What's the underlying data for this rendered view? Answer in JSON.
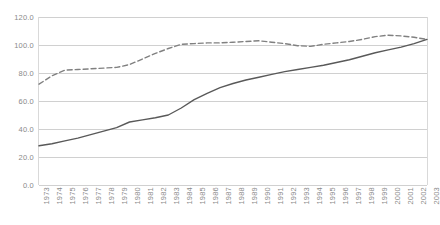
{
  "chart_data": {
    "type": "line",
    "title": "",
    "subtitle": "",
    "xlabel": "",
    "ylabel": "",
    "ylim": [
      0,
      120
    ],
    "ytick_step": 20,
    "yticks": [
      "0.0",
      "20.0",
      "40.0",
      "60.0",
      "80.0",
      "100.0",
      "120.0"
    ],
    "grid": "horizontal",
    "legend": "none",
    "x": [
      "1973",
      "1974",
      "1975",
      "1976",
      "1977",
      "1978",
      "1979",
      "1980",
      "1981",
      "1982",
      "1983",
      "1984",
      "1985",
      "1986",
      "1987",
      "1988",
      "1989",
      "1990",
      "1991",
      "1992",
      "1993",
      "1994",
      "1995",
      "1996",
      "1997",
      "1998",
      "1999",
      "2000",
      "2001",
      "2002",
      "2003"
    ],
    "series": [
      {
        "name": "dashed-series",
        "style": "dashed",
        "color": "#808080",
        "values": [
          72.0,
          78.0,
          82.0,
          82.5,
          83.0,
          83.5,
          84.0,
          86.0,
          90.0,
          94.0,
          97.5,
          100.5,
          101.0,
          101.5,
          101.5,
          102.0,
          102.5,
          103.0,
          102.0,
          101.0,
          99.5,
          99.0,
          100.5,
          101.5,
          102.5,
          104.0,
          106.0,
          107.0,
          106.5,
          105.5,
          104.0
        ]
      },
      {
        "name": "solid-series",
        "style": "solid",
        "color": "#595959",
        "values": [
          28.0,
          29.5,
          31.5,
          33.5,
          36.0,
          38.5,
          41.0,
          45.0,
          46.5,
          48.0,
          50.0,
          55.0,
          61.0,
          65.5,
          69.5,
          72.5,
          75.0,
          77.0,
          79.0,
          81.0,
          82.5,
          84.0,
          85.5,
          87.5,
          89.5,
          92.0,
          94.5,
          96.5,
          98.5,
          101.0,
          104.0
        ]
      }
    ]
  }
}
